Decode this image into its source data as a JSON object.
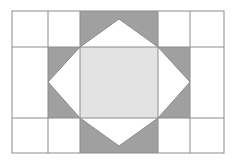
{
  "figure": {
    "type": "quilt-block-diagram",
    "canvas": {
      "width": 236,
      "height": 164
    },
    "background_color": "#ffffff"
  },
  "colors": {
    "background": "#ffffff",
    "block_background": "#ffffff",
    "star_point": "#a0a0a0",
    "center_square": "#e3e3e3",
    "grid_line": "#8c8c8c",
    "outline": "#8c8c8c"
  },
  "block": {
    "name": "block-frame",
    "x": 12,
    "y": 11,
    "width": 212,
    "height": 142,
    "columns": [
      12,
      48,
      80,
      158,
      190,
      224
    ],
    "rows": [
      11,
      47,
      118,
      153
    ],
    "column_count": 5,
    "row_count": 3
  },
  "grid_lines": {
    "vertical_x": [
      48,
      80,
      158,
      190
    ],
    "horizontal_y": [
      47,
      118
    ]
  },
  "star": {
    "name": "sawtooth-star",
    "left": 48,
    "right": 190,
    "top": 11,
    "bottom": 153,
    "inner_left": 80,
    "inner_right": 158,
    "inner_top": 47,
    "inner_bottom": 118,
    "points": [
      {
        "name": "star-point-top",
        "fill": "#a0a0a0",
        "polygon": "80,11 158,11 158,47 119,19 80,47"
      },
      {
        "name": "star-point-bottom",
        "fill": "#a0a0a0",
        "polygon": "80,153 80,118 119,146 158,118 158,153"
      },
      {
        "name": "star-point-left",
        "fill": "#a0a0a0",
        "polygon": "48,47 80,47 48,82 80,118 48,118"
      },
      {
        "name": "star-point-right",
        "fill": "#a0a0a0",
        "polygon": "190,47 190,118 158,118 190,82 158,47"
      }
    ],
    "center": {
      "name": "center-square",
      "fill": "#e3e3e3",
      "x": 80,
      "y": 47,
      "width": 78,
      "height": 71
    }
  },
  "corner_cells": [
    {
      "name": "corner-cell-top-left",
      "fill": "#ffffff",
      "x": 48,
      "y": 11,
      "width": 32,
      "height": 36
    },
    {
      "name": "corner-cell-top-right",
      "fill": "#ffffff",
      "x": 158,
      "y": 11,
      "width": 32,
      "height": 36
    },
    {
      "name": "corner-cell-bottom-left",
      "fill": "#ffffff",
      "x": 48,
      "y": 118,
      "width": 32,
      "height": 35
    },
    {
      "name": "corner-cell-bottom-right",
      "fill": "#ffffff",
      "x": 158,
      "y": 118,
      "width": 32,
      "height": 35
    }
  ],
  "side_panels": [
    {
      "name": "side-panel-left",
      "fill": "#ffffff",
      "x": 12,
      "y": 11,
      "width": 36,
      "height": 142
    },
    {
      "name": "side-panel-right",
      "fill": "#ffffff",
      "x": 190,
      "y": 11,
      "width": 34,
      "height": 142
    }
  ]
}
